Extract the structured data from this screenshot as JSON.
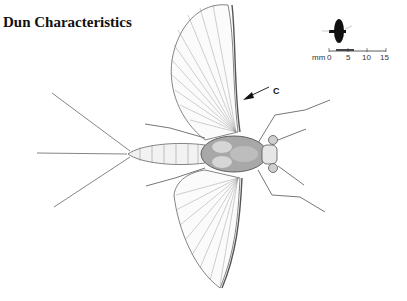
{
  "title": "Dun Characteristics",
  "callout": {
    "label": "C",
    "icon": "arrow-left-icon"
  },
  "scale_bar": {
    "unit": "mm",
    "ticks": [
      "0",
      "5",
      "10",
      "15"
    ],
    "icon": "mayfly-silhouette-icon"
  },
  "illustration": {
    "subject": "mayfly dun, dorsal view, wings spread",
    "line_color": "#555555",
    "shade_color": "#9a9a9a"
  }
}
